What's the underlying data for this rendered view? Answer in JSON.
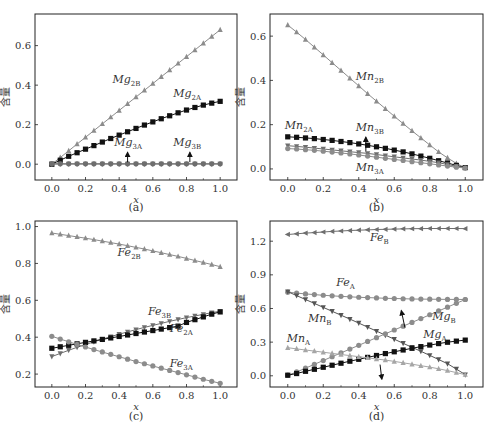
{
  "figure": {
    "panels": [
      "(a)",
      "(b)",
      "(c)",
      "(d)"
    ],
    "ylabel": "含量",
    "xlabel": "x"
  },
  "colors": {
    "black": "#111111",
    "gray": "#8c8c8c",
    "gray_dark": "#6e6e6e",
    "gray_light": "#a6a6a6",
    "frame": "#222222"
  },
  "chart_data": [
    {
      "id": "a",
      "type": "line",
      "title": "(a)",
      "xlabel": "x",
      "ylabel": "含量",
      "xlim": [
        -0.1,
        1.1
      ],
      "ylim": [
        -0.08,
        0.76
      ],
      "xticks": [
        0.0,
        0.2,
        0.4,
        0.6,
        0.8,
        1.0
      ],
      "yticks": [
        0.0,
        0.2,
        0.4,
        0.6
      ],
      "xtick_labels": [
        "0.0",
        "0.2",
        "0.4",
        "0.6",
        "0.8",
        "1.0"
      ],
      "ytick_labels": [
        "0.0",
        "0.2",
        "0.4",
        "0.6"
      ],
      "x": [
        0,
        0.05,
        0.1,
        0.15,
        0.2,
        0.25,
        0.3,
        0.35,
        0.4,
        0.45,
        0.5,
        0.55,
        0.6,
        0.65,
        0.7,
        0.75,
        0.8,
        0.85,
        0.9,
        0.95,
        1.0
      ],
      "series": [
        {
          "name": "Mg2B",
          "label_base": "Mg",
          "label_sub": "2B",
          "marker": "triangle-up",
          "color": "#8c8c8c",
          "values": [
            0.0,
            0.034,
            0.068,
            0.102,
            0.136,
            0.17,
            0.204,
            0.238,
            0.272,
            0.306,
            0.34,
            0.374,
            0.408,
            0.442,
            0.476,
            0.51,
            0.544,
            0.578,
            0.612,
            0.646,
            0.68
          ]
        },
        {
          "name": "Mg2A",
          "label_base": "Mg",
          "label_sub": "2A",
          "marker": "square",
          "color": "#111111",
          "values": [
            0.0,
            0.02,
            0.04,
            0.058,
            0.076,
            0.094,
            0.112,
            0.13,
            0.147,
            0.164,
            0.181,
            0.198,
            0.214,
            0.23,
            0.245,
            0.26,
            0.274,
            0.287,
            0.299,
            0.309,
            0.318
          ]
        },
        {
          "name": "Mg3A",
          "label_base": "Mg",
          "label_sub": "3A",
          "marker": "circle",
          "color": "#6e6e6e",
          "values": [
            0.002,
            0.002,
            0.002,
            0.002,
            0.002,
            0.002,
            0.002,
            0.002,
            0.002,
            0.002,
            0.002,
            0.002,
            0.002,
            0.002,
            0.002,
            0.002,
            0.002,
            0.002,
            0.002,
            0.002,
            0.002
          ]
        },
        {
          "name": "Mg3B",
          "label_base": "Mg",
          "label_sub": "3B",
          "marker": "triangle-down",
          "color": "#6e6e6e",
          "values": [
            0.001,
            0.001,
            0.001,
            0.001,
            0.001,
            0.001,
            0.001,
            0.001,
            0.001,
            0.001,
            0.001,
            0.001,
            0.001,
            0.001,
            0.001,
            0.001,
            0.001,
            0.001,
            0.001,
            0.001,
            0.001
          ]
        }
      ],
      "annotations": [
        {
          "text_base": "Mg",
          "text_sub": "2B",
          "x": 0.42,
          "y": 0.41
        },
        {
          "text_base": "Mg",
          "text_sub": "2A",
          "x": 0.78,
          "y": 0.34
        },
        {
          "text_base": "Mg",
          "text_sub": "3A",
          "x": 0.43,
          "y": 0.09,
          "arrow_to": [
            0.45,
            0.005
          ]
        },
        {
          "text_base": "Mg",
          "text_sub": "3B",
          "x": 0.78,
          "y": 0.09,
          "arrow_to": [
            0.82,
            0.005
          ]
        }
      ]
    },
    {
      "id": "b",
      "type": "line",
      "title": "(b)",
      "xlabel": "x",
      "ylabel": "含量",
      "xlim": [
        -0.1,
        1.1
      ],
      "ylim": [
        -0.05,
        0.7
      ],
      "xticks": [
        0.0,
        0.2,
        0.4,
        0.6,
        0.8,
        1.0
      ],
      "yticks": [
        0.0,
        0.2,
        0.4,
        0.6
      ],
      "xtick_labels": [
        "0.0",
        "0.2",
        "0.4",
        "0.6",
        "0.8",
        "1.0"
      ],
      "ytick_labels": [
        "0.0",
        "0.2",
        "0.4",
        "0.6"
      ],
      "x": [
        0,
        0.05,
        0.1,
        0.15,
        0.2,
        0.25,
        0.3,
        0.35,
        0.4,
        0.45,
        0.5,
        0.55,
        0.6,
        0.65,
        0.7,
        0.75,
        0.8,
        0.85,
        0.9,
        0.95,
        1.0
      ],
      "series": [
        {
          "name": "Mn2B",
          "label_base": "Mn",
          "label_sub": "2B",
          "marker": "triangle-up",
          "color": "#8c8c8c",
          "values": [
            0.65,
            0.618,
            0.585,
            0.55,
            0.515,
            0.48,
            0.445,
            0.41,
            0.375,
            0.34,
            0.306,
            0.272,
            0.238,
            0.205,
            0.172,
            0.14,
            0.108,
            0.077,
            0.05,
            0.025,
            0.005
          ]
        },
        {
          "name": "Mn2A",
          "label_base": "Mn",
          "label_sub": "2A",
          "marker": "square",
          "color": "#111111",
          "values": [
            0.145,
            0.143,
            0.14,
            0.137,
            0.133,
            0.129,
            0.124,
            0.119,
            0.113,
            0.107,
            0.1,
            0.093,
            0.085,
            0.077,
            0.068,
            0.058,
            0.048,
            0.037,
            0.027,
            0.016,
            0.006
          ]
        },
        {
          "name": "Mn3B",
          "label_base": "Mn",
          "label_sub": "3B",
          "marker": "triangle-down",
          "color": "#6e6e6e",
          "values": [
            0.105,
            0.102,
            0.098,
            0.094,
            0.09,
            0.086,
            0.082,
            0.078,
            0.074,
            0.07,
            0.065,
            0.06,
            0.055,
            0.05,
            0.045,
            0.04,
            0.034,
            0.028,
            0.02,
            0.012,
            0.005
          ]
        },
        {
          "name": "Mn3A",
          "label_base": "Mn",
          "label_sub": "3A",
          "marker": "circle",
          "color": "#8c8c8c",
          "values": [
            0.092,
            0.09,
            0.087,
            0.084,
            0.08,
            0.076,
            0.072,
            0.068,
            0.063,
            0.058,
            0.053,
            0.048,
            0.043,
            0.038,
            0.033,
            0.028,
            0.023,
            0.018,
            0.013,
            0.008,
            0.004
          ]
        }
      ],
      "annotations": [
        {
          "text_base": "Mn",
          "text_sub": "2B",
          "x": 0.44,
          "y": 0.4
        },
        {
          "text_base": "Mn",
          "text_sub": "2A",
          "x": 0.04,
          "y": 0.18
        },
        {
          "text_base": "Mn",
          "text_sub": "3B",
          "x": 0.44,
          "y": 0.17,
          "arrow_to": [
            0.44,
            0.075
          ]
        },
        {
          "text_base": "Mn",
          "text_sub": "3A",
          "x": 0.44,
          "y": -0.01
        }
      ]
    },
    {
      "id": "c",
      "type": "line",
      "title": "(c)",
      "xlabel": "x",
      "ylabel": "含量",
      "xlim": [
        -0.1,
        1.1
      ],
      "ylim": [
        0.13,
        1.03
      ],
      "xticks": [
        0.0,
        0.2,
        0.4,
        0.6,
        0.8,
        1.0
      ],
      "yticks": [
        0.2,
        0.4,
        0.6,
        0.8,
        1.0
      ],
      "xtick_labels": [
        "0.0",
        "0.2",
        "0.4",
        "0.6",
        "0.8",
        "1.0"
      ],
      "ytick_labels": [
        "0.2",
        "0.4",
        "0.6",
        "0.8",
        "1.0"
      ],
      "x": [
        0,
        0.05,
        0.1,
        0.15,
        0.2,
        0.25,
        0.3,
        0.35,
        0.4,
        0.45,
        0.5,
        0.55,
        0.6,
        0.65,
        0.7,
        0.75,
        0.8,
        0.85,
        0.9,
        0.95,
        1.0
      ],
      "series": [
        {
          "name": "Fe2B",
          "label_base": "Fe",
          "label_sub": "2B",
          "marker": "triangle-up",
          "color": "#8c8c8c",
          "values": [
            0.965,
            0.958,
            0.951,
            0.944,
            0.937,
            0.929,
            0.921,
            0.913,
            0.905,
            0.896,
            0.887,
            0.878,
            0.868,
            0.858,
            0.848,
            0.838,
            0.827,
            0.816,
            0.805,
            0.794,
            0.782
          ]
        },
        {
          "name": "Fe3B",
          "label_base": "Fe",
          "label_sub": "3B",
          "marker": "triangle-down",
          "color": "#6e6e6e",
          "values": [
            0.295,
            0.312,
            0.329,
            0.345,
            0.36,
            0.375,
            0.389,
            0.403,
            0.416,
            0.429,
            0.441,
            0.453,
            0.464,
            0.475,
            0.486,
            0.496,
            0.506,
            0.515,
            0.524,
            0.533,
            0.541
          ]
        },
        {
          "name": "Fe2A",
          "label_base": "Fe",
          "label_sub": "2A",
          "marker": "square",
          "color": "#111111",
          "values": [
            0.34,
            0.348,
            0.356,
            0.364,
            0.372,
            0.38,
            0.388,
            0.396,
            0.404,
            0.412,
            0.42,
            0.428,
            0.436,
            0.444,
            0.452,
            0.46,
            0.48,
            0.495,
            0.51,
            0.525,
            0.537
          ]
        },
        {
          "name": "Fe3A",
          "label_base": "Fe",
          "label_sub": "3A",
          "marker": "circle",
          "color": "#8c8c8c",
          "values": [
            0.405,
            0.39,
            0.375,
            0.361,
            0.347,
            0.333,
            0.32,
            0.307,
            0.294,
            0.281,
            0.268,
            0.256,
            0.244,
            0.232,
            0.22,
            0.208,
            0.196,
            0.184,
            0.172,
            0.161,
            0.15
          ]
        }
      ],
      "annotations": [
        {
          "text_base": "Fe",
          "text_sub": "2B",
          "x": 0.45,
          "y": 0.84
        },
        {
          "text_base": "Fe",
          "text_sub": "3B",
          "x": 0.63,
          "y": 0.52
        },
        {
          "text_base": "Fe",
          "text_sub": "2A",
          "x": 0.76,
          "y": 0.43
        },
        {
          "text_base": "Fe",
          "text_sub": "3A",
          "x": 0.76,
          "y": 0.24
        }
      ]
    },
    {
      "id": "d",
      "type": "line",
      "title": "(d)",
      "xlabel": "x",
      "ylabel": "含量",
      "xlim": [
        -0.1,
        1.1
      ],
      "ylim": [
        -0.1,
        1.38
      ],
      "xticks": [
        0.0,
        0.2,
        0.4,
        0.6,
        0.8,
        1.0
      ],
      "yticks": [
        0.0,
        0.3,
        0.6,
        0.9,
        1.2
      ],
      "xtick_labels": [
        "0.0",
        "0.2",
        "0.4",
        "0.6",
        "0.8",
        "1.0"
      ],
      "ytick_labels": [
        "0.0",
        "0.3",
        "0.6",
        "0.9",
        "1.2"
      ],
      "x": [
        0,
        0.05,
        0.1,
        0.15,
        0.2,
        0.25,
        0.3,
        0.35,
        0.4,
        0.45,
        0.5,
        0.55,
        0.6,
        0.65,
        0.7,
        0.75,
        0.8,
        0.85,
        0.9,
        0.95,
        1.0
      ],
      "series": [
        {
          "name": "FeB",
          "label_base": "Fe",
          "label_sub": "B",
          "marker": "triangle-left",
          "color": "#6e6e6e",
          "values": [
            1.26,
            1.266,
            1.272,
            1.277,
            1.282,
            1.287,
            1.291,
            1.295,
            1.298,
            1.301,
            1.304,
            1.306,
            1.308,
            1.31,
            1.311,
            1.312,
            1.313,
            1.313,
            1.313,
            1.313,
            1.312
          ]
        },
        {
          "name": "FeA",
          "label_base": "Fe",
          "label_sub": "A",
          "marker": "circle",
          "color": "#8c8c8c",
          "values": [
            0.745,
            0.737,
            0.73,
            0.724,
            0.718,
            0.713,
            0.708,
            0.704,
            0.7,
            0.697,
            0.694,
            0.691,
            0.689,
            0.687,
            0.685,
            0.684,
            0.683,
            0.682,
            0.681,
            0.681,
            0.68
          ]
        },
        {
          "name": "MnB",
          "label_base": "Mn",
          "label_sub": "B",
          "marker": "triangle-down",
          "color": "#555555",
          "values": [
            0.75,
            0.715,
            0.68,
            0.645,
            0.61,
            0.575,
            0.54,
            0.505,
            0.47,
            0.434,
            0.398,
            0.362,
            0.326,
            0.29,
            0.254,
            0.218,
            0.182,
            0.145,
            0.108,
            0.06,
            0.01
          ]
        },
        {
          "name": "MgB",
          "label_base": "Mg",
          "label_sub": "B",
          "marker": "circle",
          "color": "#8c8c8c",
          "values": [
            0.005,
            0.034,
            0.068,
            0.102,
            0.136,
            0.17,
            0.204,
            0.238,
            0.272,
            0.306,
            0.34,
            0.374,
            0.408,
            0.442,
            0.476,
            0.51,
            0.544,
            0.578,
            0.612,
            0.646,
            0.68
          ]
        },
        {
          "name": "MgA",
          "label_base": "Mg",
          "label_sub": "A",
          "marker": "square",
          "color": "#111111",
          "values": [
            0.005,
            0.02,
            0.04,
            0.058,
            0.076,
            0.094,
            0.112,
            0.13,
            0.147,
            0.164,
            0.181,
            0.198,
            0.214,
            0.23,
            0.245,
            0.26,
            0.274,
            0.287,
            0.299,
            0.309,
            0.318
          ]
        },
        {
          "name": "MnA",
          "label_base": "Mn",
          "label_sub": "A",
          "marker": "triangle-up",
          "color": "#a6a6a6",
          "values": [
            0.25,
            0.24,
            0.23,
            0.22,
            0.21,
            0.2,
            0.19,
            0.18,
            0.17,
            0.16,
            0.15,
            0.14,
            0.128,
            0.116,
            0.103,
            0.09,
            0.077,
            0.062,
            0.046,
            0.028,
            0.01
          ]
        }
      ],
      "annotations": [
        {
          "text_base": "Fe",
          "text_sub": "B",
          "x": 0.52,
          "y": 1.2
        },
        {
          "text_base": "Fe",
          "text_sub": "A",
          "x": 0.33,
          "y": 0.8
        },
        {
          "text_base": "Mn",
          "text_sub": "B",
          "x": 0.17,
          "y": 0.48
        },
        {
          "text_base": "Mn",
          "text_sub": "A",
          "x": 0.05,
          "y": 0.3
        },
        {
          "text_base": "Mg",
          "text_sub": "B",
          "x": 0.87,
          "y": 0.5
        },
        {
          "text_base": "Mg",
          "text_sub": "A",
          "x": 0.82,
          "y": 0.34
        }
      ],
      "arrows": [
        {
          "from": [
            0.66,
            0.43
          ],
          "to": [
            0.64,
            0.58
          ]
        },
        {
          "from": [
            0.52,
            0.1
          ],
          "to": [
            0.53,
            -0.03
          ]
        }
      ]
    }
  ]
}
